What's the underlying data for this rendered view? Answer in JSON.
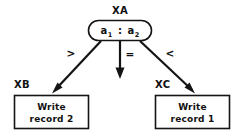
{
  "diagram": {
    "type": "decision-tree-flowchart",
    "background_color": "#ffffff",
    "stroke_color": "#141414",
    "text_color": "#111111",
    "decision_node": {
      "tag": "XA",
      "shape": "ellipse",
      "compare_left": "a",
      "compare_left_sub": "1",
      "separator": ":",
      "compare_right": "a",
      "compare_right_sub": "2"
    },
    "edges": [
      {
        "label": ">",
        "direction": "down-left",
        "target": "XB"
      },
      {
        "label": "=",
        "direction": "down",
        "target": ""
      },
      {
        "label": "<",
        "direction": "down-right",
        "target": "XC"
      }
    ],
    "process_nodes": [
      {
        "tag": "XB",
        "shape": "rectangle",
        "line1": "Write",
        "line2": "record 2"
      },
      {
        "tag": "XC",
        "shape": "rectangle",
        "line1": "Write",
        "line2": "record 1"
      }
    ]
  }
}
